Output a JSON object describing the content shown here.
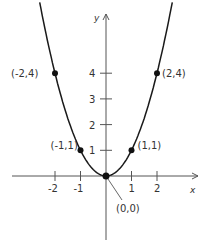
{
  "chart_data": {
    "type": "line",
    "title": "",
    "function": "y = x^2",
    "xlabel": "x",
    "ylabel": "y",
    "xlim": [
      -3.9,
      3.8
    ],
    "ylim": [
      -2.6,
      6.5
    ],
    "grid": false,
    "x_ticks": [
      -2,
      -1,
      1,
      2
    ],
    "x_tick_labels": [
      "-2",
      "-1",
      "1",
      "2"
    ],
    "y_ticks": [
      1,
      2,
      3,
      4
    ],
    "y_tick_labels": [
      "1",
      "2",
      "3",
      "4"
    ],
    "series": [
      {
        "name": "parabola",
        "x": [
          -2.55,
          -2,
          -1.5,
          -1,
          -0.5,
          0,
          0.5,
          1,
          1.5,
          2,
          2.55
        ],
        "y": [
          6.5,
          4,
          2.25,
          1,
          0.25,
          0,
          0.25,
          1,
          2.25,
          4,
          6.5
        ]
      }
    ],
    "points": [
      {
        "x": -2,
        "y": 4,
        "label": "(-2,4)"
      },
      {
        "x": 2,
        "y": 4,
        "label": "(2,4)"
      },
      {
        "x": -1,
        "y": 1,
        "label": "(-1,1)"
      },
      {
        "x": 1,
        "y": 1,
        "label": "(1,1)"
      },
      {
        "x": 0,
        "y": 0,
        "label": "(0,0)"
      }
    ],
    "annotations": [
      {
        "text": "(0,0)",
        "pointer_to": [
          0,
          0
        ],
        "style": "leader-line"
      }
    ]
  },
  "colors": {
    "curve": "#1a1a1a",
    "axis": "#555555",
    "text": "#333333"
  }
}
